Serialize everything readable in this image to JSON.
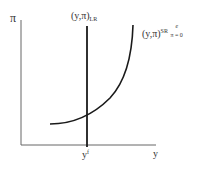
{
  "diagram": {
    "type": "economics-phillips-curve",
    "y_axis_label": "π",
    "x_axis_label": "y",
    "x_tick_label": "y",
    "x_tick_sup": "f",
    "lr_curve": {
      "label_main": "(y,π)",
      "label_sub": "LR"
    },
    "sr_curve": {
      "label_main": "(y,π)",
      "label_sup": "SR",
      "label_cond_sup": "e",
      "label_cond_sub": "π = 0"
    },
    "colors": {
      "line": "#1a1a1a",
      "axis": "#555555",
      "background": "#ffffff"
    }
  }
}
